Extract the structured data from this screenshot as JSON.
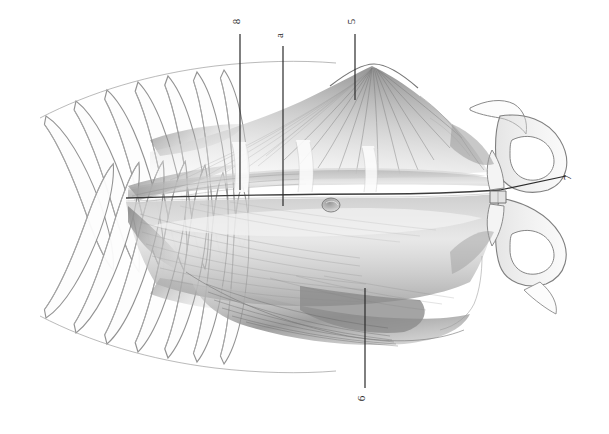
{
  "figure": {
    "medium": "graphite pencil drawing",
    "background_color": "#ffffff",
    "ink_color": "#2b2b2b",
    "width": 609,
    "height": 434
  },
  "labels": [
    {
      "id": "label-8",
      "text": "8",
      "x": 240,
      "y": 22,
      "rotation": -90,
      "leader": {
        "x1": 240,
        "y1": 34,
        "x2": 240,
        "y2": 190
      },
      "target": "upper tendinous intersection region"
    },
    {
      "id": "label-a",
      "text": "a",
      "x": 283,
      "y": 36,
      "rotation": -90,
      "leader": {
        "x1": 283,
        "y1": 46,
        "x2": 283,
        "y2": 206
      },
      "target": "rectus abdominis midline"
    },
    {
      "id": "label-5",
      "text": "5",
      "x": 355,
      "y": 22,
      "rotation": -90,
      "leader": {
        "x1": 355,
        "y1": 34,
        "x2": 355,
        "y2": 100
      },
      "target": "radiating oblique muscle fibers, upper flank"
    },
    {
      "id": "label-7",
      "text": "7",
      "x": 571,
      "y": 178,
      "rotation": -90,
      "leader": {
        "x1": 566,
        "y1": 176,
        "x2": 500,
        "y2": 190
      },
      "target": "pubic symphysis"
    },
    {
      "id": "label-6",
      "text": "6",
      "x": 365,
      "y": 399,
      "rotation": -90,
      "leader": {
        "x1": 365,
        "y1": 388,
        "x2": 365,
        "y2": 288
      },
      "target": "lower oblique muscle belly"
    }
  ],
  "structures": [
    {
      "name": "rib-cage-upper",
      "description": "series of seven curved ribs, upper left quadrant"
    },
    {
      "name": "rib-cage-lower",
      "description": "series of seven curved ribs, lower left quadrant, mirrored"
    },
    {
      "name": "rectus-abdominis",
      "description": "central longitudinal muscle band with tendinous intersections"
    },
    {
      "name": "tendinous-intersections",
      "description": "three pale transverse bands crossing the rectus"
    },
    {
      "name": "linea-alba",
      "description": "horizontal midline seam dividing upper and lower halves"
    },
    {
      "name": "external-oblique-upper",
      "description": "fan of radiating fibers above the rectus"
    },
    {
      "name": "external-oblique-lower",
      "description": "diagonal fiber mass below the rectus"
    },
    {
      "name": "umbilicus",
      "description": "small rounded node on the midline, right of centre"
    },
    {
      "name": "pelvis",
      "description": "paired innominate bones with obturator foramina at right edge"
    },
    {
      "name": "pubic-symphysis",
      "description": "narrow vertical joint between the pubic bones"
    }
  ]
}
